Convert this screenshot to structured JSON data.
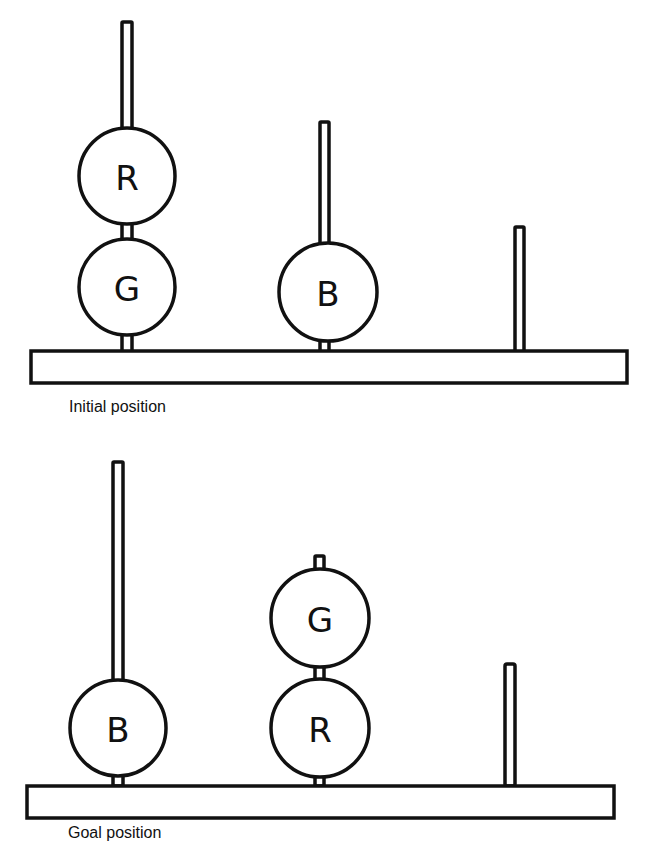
{
  "diagram": {
    "type": "tower-of-hanoi-style ball puzzle",
    "panels": [
      {
        "id": "initial",
        "caption": "Initial position",
        "pegs": [
          {
            "index": 1,
            "balls_bottom_to_top": [
              "G",
              "R"
            ]
          },
          {
            "index": 2,
            "balls_bottom_to_top": [
              "B"
            ]
          },
          {
            "index": 3,
            "balls_bottom_to_top": []
          }
        ]
      },
      {
        "id": "goal",
        "caption": "Goal position",
        "pegs": [
          {
            "index": 1,
            "balls_bottom_to_top": [
              "B"
            ]
          },
          {
            "index": 2,
            "balls_bottom_to_top": [
              "R",
              "G"
            ]
          },
          {
            "index": 3,
            "balls_bottom_to_top": []
          }
        ]
      }
    ]
  },
  "labels": {
    "initial_caption": "Initial position",
    "goal_caption": "Goal position",
    "initial": {
      "peg1_top": "R",
      "peg1_bottom": "G",
      "peg2_bottom": "B"
    },
    "goal": {
      "peg1_bottom": "B",
      "peg2_top": "G",
      "peg2_bottom": "R"
    }
  },
  "colors": {
    "line": "#111111",
    "background": "#ffffff"
  }
}
